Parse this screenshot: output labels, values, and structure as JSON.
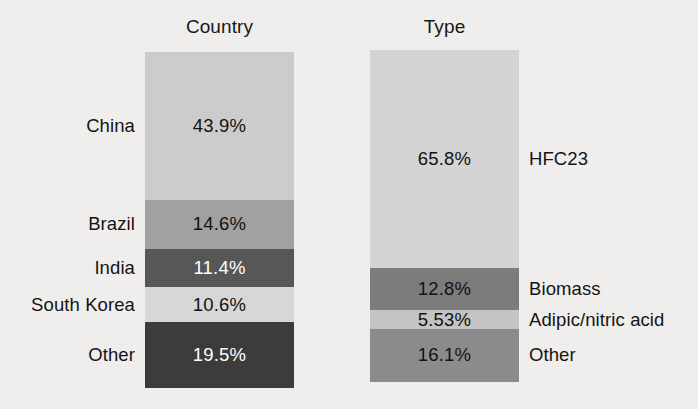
{
  "figure": {
    "background_color": "#f2f1ef",
    "text_color": "#121212"
  },
  "chart_data": {
    "type": "bar",
    "subtype": "stacked-percentage-bar",
    "title": "",
    "xlabel": "",
    "ylabel": "",
    "units": "percent",
    "grid": false,
    "legend_position": "inline-labels",
    "panels": [
      {
        "title": "Country",
        "label_side": "left",
        "categories": [
          "China",
          "Brazil",
          "India",
          "South Korea",
          "Other"
        ],
        "values": [
          43.9,
          14.6,
          11.4,
          10.6,
          19.5
        ],
        "value_labels": [
          "43.9%",
          "14.6%",
          "11.4%",
          "10.6%",
          "19.5%"
        ],
        "colors": [
          "#cdcdcd",
          "#a2a2a2",
          "#565656",
          "#d9d9d9",
          "#3b3b3b"
        ],
        "label_colors": [
          "#121212",
          "#121212",
          "#ffffff",
          "#121212",
          "#ffffff"
        ]
      },
      {
        "title": "Type",
        "label_side": "right",
        "categories": [
          "HFC23",
          "Biomass",
          "Adipic/nitric acid",
          "Other"
        ],
        "values": [
          65.8,
          12.8,
          5.53,
          16.1
        ],
        "value_labels": [
          "65.8%",
          "12.8%",
          "5.53%",
          "16.1%"
        ],
        "colors": [
          "#d6d6d6",
          "#7c7c7c",
          "#c6c6c6",
          "#8c8c8c"
        ],
        "label_colors": [
          "#121212",
          "#121212",
          "#121212",
          "#121212"
        ]
      }
    ]
  }
}
